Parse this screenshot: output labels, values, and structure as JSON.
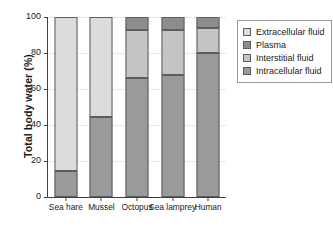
{
  "chart_data": {
    "type": "bar",
    "stacked": true,
    "title": "",
    "xlabel": "",
    "ylabel": "Total body water (%)",
    "categories": [
      "Sea hare",
      "Mussel",
      "Octopus",
      "Sea lamprey",
      "Human"
    ],
    "ylim": [
      0,
      100
    ],
    "yticks": [
      0,
      20,
      40,
      60,
      80,
      100
    ],
    "ytick_labels": [
      "0",
      "20",
      "40",
      "60",
      "80",
      "100"
    ],
    "grid": true,
    "legend_position": "right",
    "series": [
      {
        "name": "Intracellular fluid",
        "color": "#9a9a9a",
        "values": [
          14.5,
          44.5,
          66.0,
          68.0,
          80.0
        ]
      },
      {
        "name": "Interstitial fluid",
        "color": "#c4c4c4",
        "values": [
          0,
          0,
          27.0,
          25.0,
          14.0
        ]
      },
      {
        "name": "Plasma",
        "color": "#8d8d8d",
        "values": [
          0,
          0,
          7.0,
          7.0,
          6.0
        ]
      },
      {
        "name": "Extracellular fluid",
        "color": "#dcdcdc",
        "values": [
          85.5,
          55.5,
          0,
          0,
          0
        ]
      }
    ],
    "stack_order": [
      "Intracellular fluid",
      "Interstitial fluid",
      "Plasma",
      "Extracellular fluid"
    ]
  },
  "legend": {
    "items": [
      {
        "label": "Extracellular fluid",
        "color": "#dcdcdc"
      },
      {
        "label": "Plasma",
        "color": "#8d8d8d"
      },
      {
        "label": "Interstitial fluid",
        "color": "#c4c4c4"
      },
      {
        "label": "Intracellular fluid",
        "color": "#9a9a9a"
      }
    ]
  }
}
